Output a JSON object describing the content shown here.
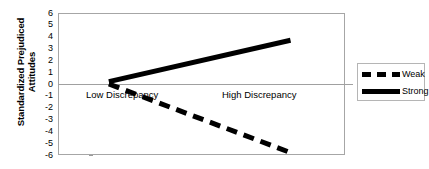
{
  "chart_data": {
    "type": "line",
    "title": "",
    "subtitle": "",
    "xlabel": "",
    "ylabel": "Standardized Prejudiced Attitudes",
    "categories": [
      "Low Discrepancy",
      "High Discrepancy"
    ],
    "x": [
      0,
      1
    ],
    "xlim": [
      -0.28,
      1.3
    ],
    "ylim": [
      -6,
      6
    ],
    "ytick_labels": [
      "6",
      "5",
      "4",
      "3",
      "2",
      "1",
      "0",
      "-1",
      "-2",
      "-3",
      "-4",
      "-5",
      "-6"
    ],
    "ytick_values": [
      6,
      5,
      4,
      3,
      2,
      1,
      0,
      -1,
      -2,
      -3,
      -4,
      -5,
      -6
    ],
    "grid": false,
    "zero_line": true,
    "legend_position": "right",
    "series": [
      {
        "name": "Weak",
        "style": "dashed",
        "color": "#000000",
        "width": 5,
        "values": [
          0.0,
          -5.8
        ]
      },
      {
        "name": "Strong",
        "style": "solid",
        "color": "#000000",
        "width": 5,
        "values": [
          0.2,
          3.7
        ]
      }
    ],
    "annotations": []
  },
  "legend": {
    "items": [
      {
        "label": "Weak",
        "style": "dashed"
      },
      {
        "label": "Strong",
        "style": "solid"
      }
    ]
  },
  "axes": {
    "y_title_line1": "Standardized Prejudiced",
    "y_title_line2": "Attitudes"
  }
}
